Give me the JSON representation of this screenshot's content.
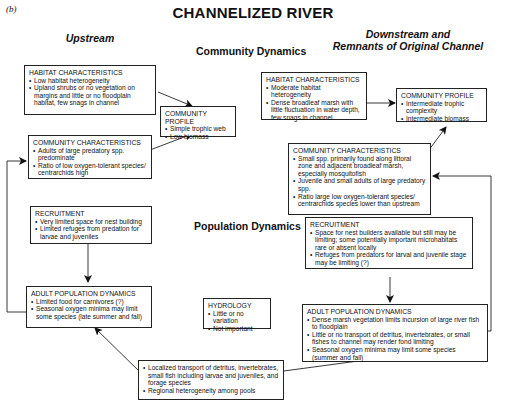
{
  "figure": {
    "panel_label": "(b)",
    "title": "CHANNELIZED RIVER",
    "column_headers": {
      "upstream": "Upstream",
      "downstream_line1": "Downstream and",
      "downstream_line2": "Remnants of Original Channel"
    },
    "section_labels": {
      "community": "Community Dynamics",
      "population": "Population Dynamics"
    }
  },
  "upstream": {
    "habitat": {
      "heading": "HABITAT CHARACTERISTICS",
      "items": [
        "Low habitat heterogeneity",
        "Upland shrubs or no vegetation on margins and little or no floodplain habitat, few snags in channel"
      ]
    },
    "community_profile": {
      "heading": "COMMUNITY PROFILE",
      "items": [
        "Simple trophic web",
        "Low biomass"
      ]
    },
    "community_characteristics": {
      "heading": "COMMUNITY CHARACTERISTICS",
      "items": [
        "Adults of large predatory spp. predominate",
        "Ratio of low oxygen-tolerant species/ centrarchids high"
      ]
    },
    "recruitment": {
      "heading": "RECRUITMENT",
      "items": [
        "Very limited space for nest building",
        "Limited refuges from predation for larvae and juveniles"
      ]
    },
    "adult_population": {
      "heading": "ADULT POPULATION DYNAMICS",
      "items": [
        "Limited food for carnivores (?)",
        "Seasonal oxygen minima may limit some species (late summer and fall)"
      ]
    }
  },
  "hydrology": {
    "heading": "HYDROLOGY",
    "items": [
      "Little or no variation",
      "Not important"
    ]
  },
  "transport": {
    "items": [
      "Localized transport of detritus, invertebrates, small fish including larvae and juveniles, and forage species",
      "Regional heterogeneity among pools"
    ]
  },
  "downstream": {
    "habitat": {
      "heading": "HABITAT CHARACTERISTICS",
      "items": [
        "Moderate habitat heterogeneity",
        "Dense broadleaf marsh with little fluctuation in water depth, few snags in channel"
      ]
    },
    "community_profile": {
      "heading": "COMMUNITY PROFILE",
      "items": [
        "Intermediate trophic complexity",
        "Intermediate biomass"
      ]
    },
    "community_characteristics": {
      "heading": "COMMUNITY CHARACTERISTICS",
      "items": [
        "Small spp. primarily found along littoral zone and adjacent broadleaf marsh, especially mosquitofish",
        "Juvenile and small adults of large predatory spp.",
        "Ratio large low oxygen-tolerant species/ centrarchids species lower than upstream"
      ]
    },
    "recruitment": {
      "heading": "RECRUITMENT",
      "items": [
        "Space for nest builders available but still may be limiting; some potentially important microhabitats rare or absent locally",
        "Refuges from predators for larval and juvenile stage may be limiting (?)"
      ]
    },
    "adult_population": {
      "heading": "ADULT POPULATION DYNAMICS",
      "items": [
        "Dense marsh vegetation limits incursion of large river fish to floodplain",
        "Little or no transport of detritus, invertebrates, or small fishes to channel may render fond limiting",
        "Seasonal oxygen minima may limit some species (summer and fall)"
      ]
    }
  }
}
